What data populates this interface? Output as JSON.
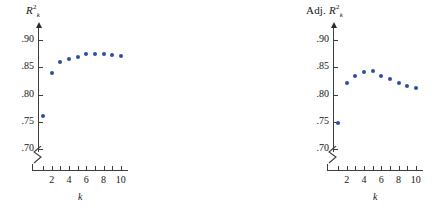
{
  "figure": {
    "background_color": "#ffffff",
    "marker_color": "#2b4fa2",
    "axis_color": "#3d3d3d",
    "panel_count": 3
  },
  "chart_data": [
    {
      "type": "scatter",
      "title": "R_k^2",
      "title_parts": {
        "base": "R",
        "sup": "2",
        "sub": "k"
      },
      "xlabel": "k",
      "ylabel": "",
      "x": [
        1,
        2,
        3,
        4,
        5,
        6,
        7,
        8,
        9,
        10
      ],
      "values": [
        0.761,
        0.84,
        0.86,
        0.866,
        0.869,
        0.874,
        0.875,
        0.875,
        0.872,
        0.871
      ],
      "xlim": [
        0.4,
        10.6
      ],
      "ylim": [
        0.695,
        0.915
      ],
      "ytick_values": [
        0.7,
        0.75,
        0.8,
        0.85,
        0.9
      ],
      "ytick_labels": [
        ".70",
        ".75",
        ".80",
        ".85",
        ".90"
      ],
      "xtick_values": [
        1,
        2,
        3,
        4,
        5,
        6,
        7,
        8,
        9,
        10
      ],
      "xtick_labels": [
        "",
        "2",
        "",
        "4",
        "",
        "6",
        "",
        "8",
        "",
        "10"
      ],
      "grid": false,
      "legend": "none",
      "axis_break": true,
      "axis_break_note": "y-axis broken below .70"
    },
    {
      "type": "scatter",
      "title": "Adj. R_k^2",
      "title_parts": {
        "prefix": "Adj. ",
        "base": "R",
        "sup": "2",
        "sub": "k"
      },
      "xlabel": "k",
      "ylabel": "",
      "x": [
        1,
        2,
        3,
        4,
        5,
        6,
        7,
        8,
        9,
        10
      ],
      "values": [
        0.748,
        0.822,
        0.834,
        0.842,
        0.844,
        0.835,
        0.829,
        0.822,
        0.816,
        0.812
      ],
      "xlim": [
        0.4,
        10.6
      ],
      "ylim": [
        0.695,
        0.915
      ],
      "ytick_values": [
        0.7,
        0.75,
        0.8,
        0.85,
        0.9
      ],
      "ytick_labels": [
        ".70",
        ".75",
        ".80",
        ".85",
        ".90"
      ],
      "xtick_values": [
        1,
        2,
        3,
        4,
        5,
        6,
        7,
        8,
        9,
        10
      ],
      "xtick_labels": [
        "",
        "2",
        "",
        "4",
        "",
        "6",
        "",
        "8",
        "",
        "10"
      ],
      "grid": false,
      "legend": "none",
      "axis_break": true,
      "axis_break_note": "y-axis broken below .70"
    },
    {
      "type": "scatter",
      "title": "C_k",
      "title_parts": {
        "base": "C",
        "sub": "k"
      },
      "xlabel": "k",
      "ylabel": "",
      "x": [
        1,
        2,
        3,
        4,
        5,
        6,
        7,
        8,
        9,
        10
      ],
      "values": [
        11.1,
        1.2,
        0.2,
        0.8,
        1.4,
        3.0,
        4.8,
        6.7,
        8.5,
        10.4
      ],
      "xlim": [
        0.4,
        10.6
      ],
      "ylim": [
        0.0,
        13.2
      ],
      "ytick_values": [
        2,
        4,
        6,
        8,
        10,
        12
      ],
      "ytick_labels": [
        "2",
        "4",
        "6",
        "8",
        "10",
        "12"
      ],
      "xtick_values": [
        1,
        2,
        3,
        4,
        5,
        6,
        7,
        8,
        9,
        10
      ],
      "xtick_labels": [
        "",
        "2",
        "",
        "4",
        "",
        "6",
        "",
        "8",
        "",
        "10"
      ],
      "grid": false,
      "legend": "none",
      "axis_break": false
    }
  ]
}
